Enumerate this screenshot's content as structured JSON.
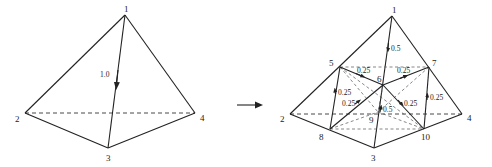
{
  "diagram": {
    "left": {
      "name": "original-tetrahedron",
      "vertices": [
        {
          "id": "1",
          "x": 125,
          "y": 15,
          "lx": 124,
          "ly": 12
        },
        {
          "id": "2",
          "x": 25,
          "y": 113,
          "lx": 15,
          "ly": 122
        },
        {
          "id": "3",
          "x": 108,
          "y": 148,
          "lx": 108,
          "ly": 161
        },
        {
          "id": "4",
          "x": 195,
          "y": 113,
          "lx": 200,
          "ly": 121
        }
      ],
      "edge_label": {
        "text": "1.0",
        "x": 100,
        "y": 77
      },
      "arrow": {
        "from": [
          125,
          15
        ],
        "to": [
          108,
          148
        ]
      }
    },
    "transition_arrow": {
      "label": "refine-arrow",
      "from": [
        238,
        105
      ],
      "to": [
        262,
        105
      ]
    },
    "right": {
      "name": "refined-tetrahedron",
      "vertices": [
        {
          "id": "1",
          "x": 392,
          "y": 16,
          "lx": 393,
          "ly": 13
        },
        {
          "id": "2",
          "x": 290,
          "y": 114,
          "lx": 279,
          "ly": 122
        },
        {
          "id": "3",
          "x": 374,
          "y": 148,
          "lx": 371,
          "ly": 161
        },
        {
          "id": "4",
          "x": 462,
          "y": 114,
          "lx": 466,
          "ly": 121
        },
        {
          "id": "5",
          "x": 340,
          "y": 67,
          "lx": 330,
          "ly": 65
        },
        {
          "id": "6",
          "x": 383,
          "y": 85,
          "lx": 377,
          "ly": 82
        },
        {
          "id": "7",
          "x": 429,
          "y": 67,
          "lx": 432,
          "ly": 65
        },
        {
          "id": "8",
          "x": 330,
          "y": 129,
          "lx": 319,
          "ly": 140
        },
        {
          "id": "9",
          "x": 378,
          "y": 112,
          "lx": 369,
          "ly": 123
        },
        {
          "id": "10",
          "x": 424,
          "y": 129,
          "lx": 421,
          "ly": 140
        }
      ],
      "edge_labels": [
        {
          "text": "0.5",
          "x": 391,
          "y": 51
        },
        {
          "text": "0.25",
          "x": 359,
          "y": 73
        },
        {
          "text": "0.25",
          "x": 397,
          "y": 73
        },
        {
          "text": "0.25",
          "x": 338,
          "y": 95
        },
        {
          "text": "0.25",
          "x": 345,
          "y": 106
        },
        {
          "text": "0.5",
          "x": 382,
          "y": 112
        },
        {
          "text": "0.25",
          "x": 404,
          "y": 106
        },
        {
          "text": "0.25",
          "x": 431,
          "y": 99
        }
      ]
    }
  }
}
